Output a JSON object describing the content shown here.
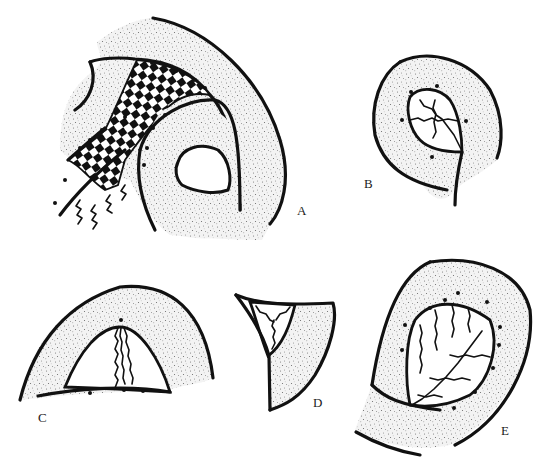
{
  "figure": {
    "panels": [
      {
        "id": "A",
        "label": "A"
      },
      {
        "id": "B",
        "label": "B"
      },
      {
        "id": "C",
        "label": "C"
      },
      {
        "id": "D",
        "label": "D"
      },
      {
        "id": "E",
        "label": "E"
      }
    ],
    "colors": {
      "ink": "#111111",
      "stipple": "#8a8a8a",
      "background": "#ffffff"
    }
  }
}
